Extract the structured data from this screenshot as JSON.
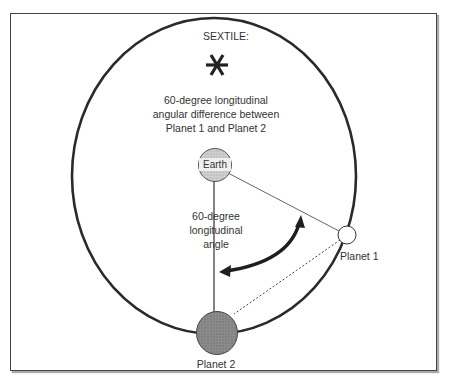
{
  "diagram": {
    "title": "SEXTILE:",
    "symbol": "sextile-asterisk",
    "description_lines": [
      "60-degree longitudinal",
      "angular difference between",
      "Planet 1 and Planet 2"
    ],
    "angle_label_lines": [
      "60-degree",
      "longitudinal",
      "angle"
    ],
    "bodies": {
      "earth": "Earth",
      "planet1": "Planet 1",
      "planet2": "Planet 2"
    },
    "colors": {
      "stroke": "#2a2a2a",
      "earth_fill": "#c8c8c8",
      "planet1_fill": "#ffffff",
      "planet2_fill": "#8a8a8a"
    }
  }
}
